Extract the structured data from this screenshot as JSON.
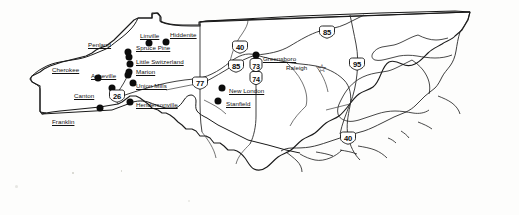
{
  "map": {
    "title": "North Carolina",
    "subject": "gem-mining and rockhounding locations in North Carolina",
    "state_outline_color": "#1a1a1a",
    "road_color": "#2b2b2b",
    "marker_color": "#0c0c0c",
    "background_color": "#fdfdfc",
    "capital": {
      "name": "Raleigh",
      "symbol": "star-icon",
      "glyph": "☆",
      "underlined": false,
      "x": 322,
      "y": 68,
      "label_x": 286,
      "label_y": 64
    },
    "cities": [
      {
        "name": "Cherokee",
        "x": 98,
        "y": 78,
        "label_x": 52,
        "label_y": 66
      },
      {
        "name": "Franklin",
        "x": 100,
        "y": 108,
        "label_x": 52,
        "label_y": 118
      },
      {
        "name": "Canton",
        "x": 112,
        "y": 88,
        "label_x": 74,
        "label_y": 92
      },
      {
        "name": "Asheville",
        "x": 128,
        "y": 75,
        "label_x": 91,
        "label_y": 72
      },
      {
        "name": "Penland",
        "x": 128,
        "y": 52,
        "label_x": 88,
        "label_y": 41
      },
      {
        "name": "Linville",
        "x": 149,
        "y": 43,
        "label_x": 140,
        "label_y": 32
      },
      {
        "name": "Hiddenite",
        "x": 166,
        "y": 42,
        "label_x": 170,
        "label_y": 31
      },
      {
        "name": "Spruce Pine",
        "x": 129,
        "y": 57,
        "label_x": 136,
        "label_y": 44
      },
      {
        "name": "Little Switzerland",
        "x": 130,
        "y": 64,
        "label_x": 136,
        "label_y": 58
      },
      {
        "name": "Marion",
        "x": 129,
        "y": 72,
        "label_x": 136,
        "label_y": 68
      },
      {
        "name": "Union Mills",
        "x": 133,
        "y": 83,
        "label_x": 136,
        "label_y": 82
      },
      {
        "name": "Hendersonville",
        "x": 130,
        "y": 102,
        "label_x": 136,
        "label_y": 101
      },
      {
        "name": "New London",
        "x": 222,
        "y": 88,
        "label_x": 229,
        "label_y": 87
      },
      {
        "name": "Stanfield",
        "x": 218,
        "y": 101,
        "label_x": 226,
        "label_y": 100
      },
      {
        "name": "Greensboro",
        "x": 256,
        "y": 55,
        "label_x": 263,
        "label_y": 55
      }
    ],
    "highway_shields": [
      {
        "number": "40",
        "x": 240,
        "y": 47,
        "style": "wide"
      },
      {
        "number": "85",
        "x": 236,
        "y": 66,
        "style": "wide"
      },
      {
        "number": "85",
        "x": 327,
        "y": 32,
        "style": "wide"
      },
      {
        "number": "95",
        "x": 357,
        "y": 64,
        "style": "wide"
      },
      {
        "number": "77",
        "x": 200,
        "y": 83,
        "style": "wide"
      },
      {
        "number": "26",
        "x": 117,
        "y": 96,
        "style": "wide"
      },
      {
        "number": "73",
        "x": 256,
        "y": 65,
        "style": "tall"
      },
      {
        "number": "74",
        "x": 256,
        "y": 78,
        "style": "tall"
      },
      {
        "number": "40",
        "x": 348,
        "y": 138,
        "style": "wide"
      }
    ],
    "legend_notes": []
  }
}
